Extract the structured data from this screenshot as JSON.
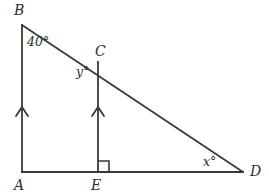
{
  "figure": {
    "type": "geometry-diagram",
    "title": "",
    "background_color": "#ffffff",
    "stroke_color": "#3a3a3a",
    "text_color": "#2e2e2e",
    "vertices": [
      {
        "name": "A",
        "label": "A",
        "x": 22,
        "y": 172,
        "label_x": 14,
        "label_y": 178
      },
      {
        "name": "B",
        "label": "B",
        "x": 22,
        "y": 25,
        "label_x": 14,
        "label_y": 3
      },
      {
        "name": "C",
        "label": "C",
        "x": 98,
        "y": 62,
        "label_x": 95,
        "label_y": 44
      },
      {
        "name": "D",
        "label": "D",
        "x": 243,
        "y": 172,
        "label_x": 250,
        "label_y": 164
      },
      {
        "name": "E",
        "label": "E",
        "x": 98,
        "y": 172,
        "label_x": 91,
        "label_y": 178
      }
    ],
    "segments": [
      {
        "name": "segment-AB",
        "from": "A",
        "to": "B"
      },
      {
        "name": "segment-BD",
        "from": "B",
        "to": "D"
      },
      {
        "name": "segment-AD",
        "from": "A",
        "to": "D"
      },
      {
        "name": "segment-CE",
        "from": "C",
        "to": "E"
      }
    ],
    "angle_labels": [
      {
        "name": "angle-b",
        "text": "40°",
        "x": 27,
        "y": 36,
        "size": "big"
      },
      {
        "name": "angle-y",
        "text": "y°",
        "x": 76,
        "y": 66,
        "size": "big"
      },
      {
        "name": "angle-x",
        "text": "x°",
        "x": 203,
        "y": 156,
        "size": "big"
      }
    ],
    "marks": {
      "right_angle": {
        "name": "right-angle-mark-at-E",
        "x": 98,
        "y": 172,
        "size": 11,
        "side": "right"
      },
      "parallel_arrows": [
        {
          "name": "parallel-mark-AB",
          "x": 22,
          "y": 108
        },
        {
          "name": "parallel-mark-CE",
          "x": 98,
          "y": 108
        }
      ]
    }
  }
}
